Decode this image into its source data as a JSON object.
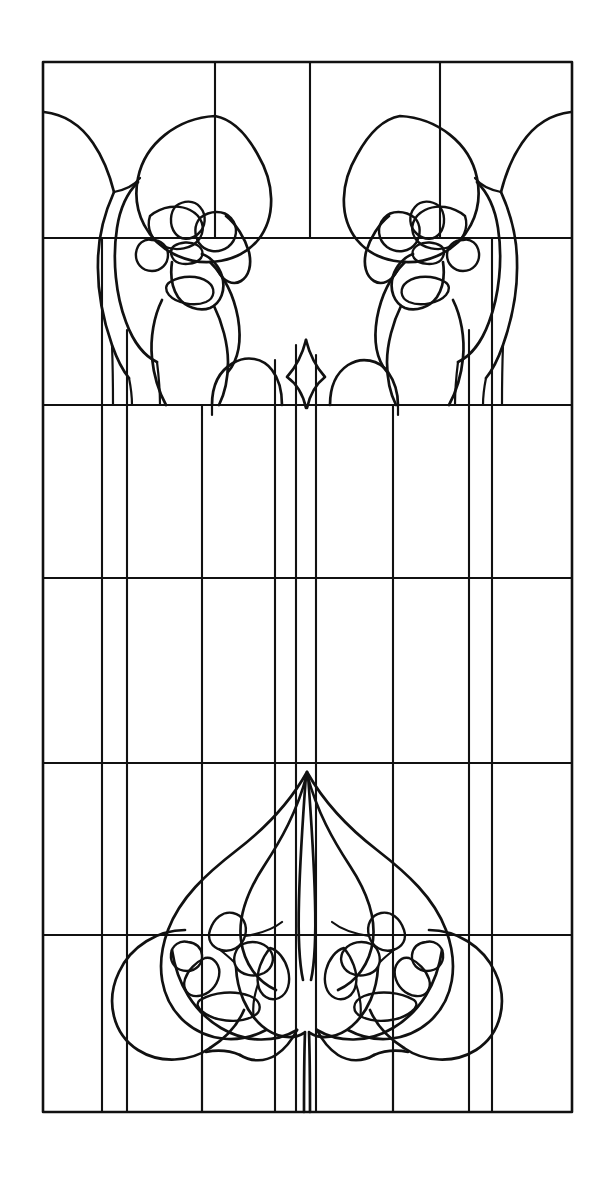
{
  "document": {
    "title": "Stained Glass Window Pattern",
    "type": "line-art-pattern",
    "background_color": "#ffffff",
    "ink_color": "#111111",
    "canvas": {
      "width": 605,
      "height": 1185
    }
  },
  "artwork": {
    "name": "art-nouveau-stained-glass-panel",
    "description": "Vertical rectangular leaded-glass cartoon with two mirrored bud motifs at the top and one large central lotus bud motif at the bottom, set over a rectilinear came grid.",
    "border": {
      "x1": 43,
      "y1": 62,
      "x2": 572,
      "y2": 1112
    },
    "grid": {
      "horizontal_y": [
        238,
        405,
        578,
        763,
        935
      ],
      "vertical_x": [
        102,
        127,
        202,
        275,
        296,
        316,
        393,
        469,
        492
      ],
      "top_short_vertical_x": [
        215,
        310,
        440
      ],
      "top_short_vertical_y2": 238
    },
    "motifs": [
      {
        "name": "top-left-bud",
        "center_x": 162,
        "top_y": 116,
        "mirrored": false
      },
      {
        "name": "top-right-bud",
        "center_x": 452,
        "top_y": 116,
        "mirrored": true
      },
      {
        "name": "bottom-center-lotus",
        "center_x": 307,
        "apex_y": 772
      },
      {
        "name": "center-arcade",
        "left_arch_x": 202,
        "right_arch_x": 412,
        "arch_top_y": 360
      }
    ],
    "palette": {
      "paper": "#ffffff",
      "line": "#111111"
    }
  }
}
